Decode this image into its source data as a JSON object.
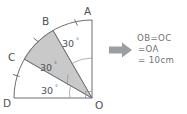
{
  "figure": {
    "vertices": [
      {
        "id": "A",
        "label": "A",
        "x": 92,
        "y": 20,
        "label_x": 86,
        "label_y": 12
      },
      {
        "id": "B",
        "label": "B",
        "x": 53,
        "y": 30.4,
        "label_x": 43,
        "label_y": 23
      },
      {
        "id": "C",
        "label": "C",
        "x": 24,
        "y": 59,
        "label_x": 12,
        "label_y": 58
      },
      {
        "id": "D",
        "label": "D",
        "x": 14,
        "y": 98,
        "label_x": 4,
        "label_y": 105
      },
      {
        "id": "O",
        "label": "O",
        "x": 92,
        "y": 98,
        "label_x": 96,
        "label_y": 106
      }
    ],
    "center": "O",
    "radius_px": 78,
    "angles": [
      {
        "id": "angle-AOB",
        "value": "30",
        "degree_symbol": "°",
        "x": 66,
        "y": 43
      },
      {
        "id": "angle-BOC",
        "value": "30",
        "degree_symbol": "°",
        "x": 44,
        "y": 67
      },
      {
        "id": "angle-COD",
        "value": "30",
        "degree_symbol": "°",
        "x": 45,
        "y": 90
      }
    ],
    "shaded_sector": "BOC",
    "arc_tick_count": 3,
    "colors": {
      "stroke": "#6b6e72",
      "shade_fill": "#c9c9c9",
      "text": "#4e5155",
      "arrow": "#9b9ea2",
      "note_text": "#6f7276",
      "background": "#ffffff"
    }
  },
  "arrow": {
    "name": "right-arrow",
    "direction": "right"
  },
  "note": {
    "lines": [
      "OB=OC",
      "=OA",
      "= 10cm"
    ]
  }
}
